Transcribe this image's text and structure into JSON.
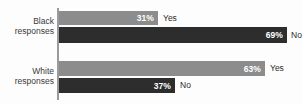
{
  "chart_data": {
    "type": "bar",
    "title": "",
    "xlabel": "",
    "ylabel": "",
    "orientation": "horizontal",
    "xlim": [
      0,
      100
    ],
    "grid": false,
    "legend_position": "inline-labels",
    "categories": [
      "Black responses",
      "White responses"
    ],
    "series": [
      {
        "name": "Yes",
        "values": [
          31,
          63
        ],
        "color": "#8c8c8c"
      },
      {
        "name": "No",
        "values": [
          69,
          37
        ],
        "color": "#2d2d2d"
      }
    ],
    "bars": [
      {
        "group": "Black responses",
        "answer": "Yes",
        "value": 31,
        "value_label": "31%",
        "color": "#8c8c8c"
      },
      {
        "group": "Black responses",
        "answer": "No",
        "value": 69,
        "value_label": "69%",
        "color": "#2d2d2d"
      },
      {
        "group": "White responses",
        "answer": "Yes",
        "value": 63,
        "value_label": "63%",
        "color": "#8c8c8c"
      },
      {
        "group": "White responses",
        "answer": "No",
        "value": 37,
        "value_label": "37%",
        "color": "#2d2d2d"
      }
    ]
  },
  "title_sliver": {
    "text": "                "
  },
  "groups": {
    "black": {
      "line1": "Black",
      "line2": "responses"
    },
    "white": {
      "line1": "White",
      "line2": "responses"
    }
  },
  "bars": {
    "black_yes": {
      "pct": "31%",
      "answer": "Yes"
    },
    "black_no": {
      "pct": "69%",
      "answer": "No"
    },
    "white_yes": {
      "pct": "63%",
      "answer": "Yes"
    },
    "white_no": {
      "pct": "37%",
      "answer": "No"
    }
  },
  "colors": {
    "yes_bar": "#8c8c8c",
    "no_bar": "#2d2d2d",
    "axis": "#9a9a9a",
    "label_text": "#3a3a3a",
    "bar_text": "#ffffff",
    "background": "#fdfdfd"
  }
}
